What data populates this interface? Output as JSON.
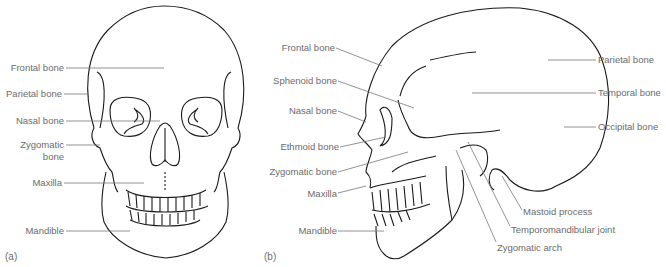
{
  "figure": {
    "panels": [
      {
        "tag": "(a)",
        "view": "anterior",
        "labels": [
          "Frontal bone",
          "Parietal bone",
          "Nasal bone",
          "Zygomatic bone",
          "Maxilla",
          "Mandible"
        ],
        "zygomatic_line1": "Zygomatic",
        "zygomatic_line2": "bone"
      },
      {
        "tag": "(b)",
        "view": "lateral",
        "left_labels": [
          "Frontal bone",
          "Sphenoid bone",
          "Nasal bone",
          "Ethmoid bone",
          "Zygomatic bone",
          "Maxilla",
          "Mandible"
        ],
        "right_labels": [
          "Parietal bone",
          "Temporal bone",
          "Occipital bone"
        ],
        "bottom_labels": [
          "Mastoid process",
          "Temporomandibular joint",
          "Zygomatic arch"
        ]
      }
    ],
    "colors": {
      "outline": "#1a1a1a",
      "leader": "#777777",
      "label": "#6b6b6b"
    }
  }
}
